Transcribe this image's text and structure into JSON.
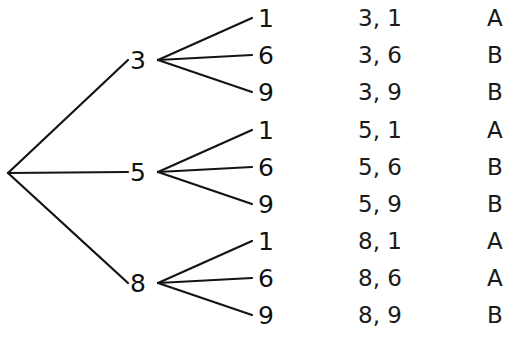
{
  "diagram": {
    "type": "probability-tree-diagram",
    "title": "",
    "background_color": "#ffffff",
    "line_color": "#141414",
    "text_color": "#1a1a1a",
    "root": {
      "label": "",
      "x": 8,
      "y": 173
    },
    "level1": [
      {
        "label": "3",
        "x": 138,
        "y": 60,
        "vertex_x": 158
      },
      {
        "label": "5",
        "x": 138,
        "y": 172,
        "vertex_x": 158
      },
      {
        "label": "8",
        "x": 138,
        "y": 283,
        "vertex_x": 158
      }
    ],
    "level2_values": [
      "1",
      "6",
      "9"
    ],
    "rows": [
      {
        "leaf": "1",
        "pair": "3, 1",
        "letter": "A",
        "y": 18,
        "parent": "3"
      },
      {
        "leaf": "6",
        "pair": "3, 6",
        "letter": "B",
        "y": 55,
        "parent": "3"
      },
      {
        "leaf": "9",
        "pair": "3, 9",
        "letter": "B",
        "y": 92,
        "parent": "3"
      },
      {
        "leaf": "1",
        "pair": "5, 1",
        "letter": "A",
        "y": 130,
        "parent": "5"
      },
      {
        "leaf": "6",
        "pair": "5, 6",
        "letter": "B",
        "y": 167,
        "parent": "5"
      },
      {
        "leaf": "9",
        "pair": "5, 9",
        "letter": "B",
        "y": 204,
        "parent": "5"
      },
      {
        "leaf": "1",
        "pair": "8, 1",
        "letter": "A",
        "y": 241,
        "parent": "8"
      },
      {
        "leaf": "6",
        "pair": "8, 6",
        "letter": "A",
        "y": 278,
        "parent": "8"
      },
      {
        "leaf": "9",
        "pair": "8, 9",
        "letter": "B",
        "y": 315,
        "parent": "8"
      }
    ],
    "columns": {
      "leaf_x": 258,
      "pair_x": 358,
      "letter_x": 487
    },
    "edges_level1": [
      {
        "from_x": 8,
        "from_y": 173,
        "to_x": 128,
        "to_y": 60
      },
      {
        "from_x": 8,
        "from_y": 173,
        "to_x": 128,
        "to_y": 172
      },
      {
        "from_x": 8,
        "from_y": 173,
        "to_x": 128,
        "to_y": 283
      }
    ],
    "edges_level2": [
      {
        "from_x": 158,
        "from_y": 60,
        "to_x": 252,
        "to_y": 18
      },
      {
        "from_x": 158,
        "from_y": 60,
        "to_x": 252,
        "to_y": 55
      },
      {
        "from_x": 158,
        "from_y": 60,
        "to_x": 252,
        "to_y": 92
      },
      {
        "from_x": 158,
        "from_y": 172,
        "to_x": 252,
        "to_y": 130
      },
      {
        "from_x": 158,
        "from_y": 172,
        "to_x": 252,
        "to_y": 167
      },
      {
        "from_x": 158,
        "from_y": 172,
        "to_x": 252,
        "to_y": 204
      },
      {
        "from_x": 158,
        "from_y": 283,
        "to_x": 252,
        "to_y": 241
      },
      {
        "from_x": 158,
        "from_y": 283,
        "to_x": 252,
        "to_y": 278
      },
      {
        "from_x": 158,
        "from_y": 283,
        "to_x": 252,
        "to_y": 315
      }
    ]
  },
  "chart_data": {
    "type": "tree",
    "stage1": [
      "3",
      "5",
      "8"
    ],
    "stage2": [
      "1",
      "6",
      "9"
    ],
    "outcomes": [
      {
        "pair": "3, 1",
        "category": "A"
      },
      {
        "pair": "3, 6",
        "category": "B"
      },
      {
        "pair": "3, 9",
        "category": "B"
      },
      {
        "pair": "5, 1",
        "category": "A"
      },
      {
        "pair": "5, 6",
        "category": "B"
      },
      {
        "pair": "5, 9",
        "category": "B"
      },
      {
        "pair": "8, 1",
        "category": "A"
      },
      {
        "pair": "8, 6",
        "category": "A"
      },
      {
        "pair": "8, 9",
        "category": "B"
      }
    ],
    "category_counts": {
      "A": 4,
      "B": 5
    },
    "total_outcomes": 9,
    "xlabel": "",
    "ylabel": "",
    "grid": false,
    "legend": "none"
  }
}
